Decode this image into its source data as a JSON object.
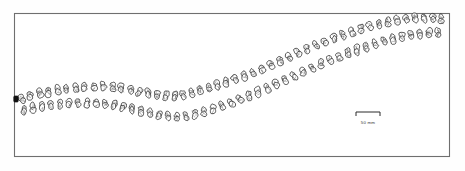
{
  "figure": {
    "background_color": "#ffffff",
    "ink_color": "#1d1d1d",
    "frame_color": "#6f6f6f"
  },
  "frame": {
    "x": 14,
    "y": 13,
    "width": 436,
    "height": 144,
    "stroke_width": 1.1
  },
  "scalebar": {
    "label": "50 mm",
    "x1": 356,
    "x2": 380,
    "y": 112,
    "tick_height": 4,
    "label_x": 368,
    "label_y": 124
  },
  "chart_data": {
    "type": "scatter",
    "xlabel": "",
    "ylabel": "",
    "xlim": [
      14,
      450
    ],
    "ylim": [
      13,
      157
    ],
    "grid": false,
    "legend": "none",
    "annotations": [
      "50 mm"
    ],
    "series": [
      {
        "name": "upper row",
        "points": [
          [
            22,
            99
          ],
          [
            30,
            96
          ],
          [
            40,
            93
          ],
          [
            48,
            92
          ],
          [
            58,
            90
          ],
          [
            66,
            89
          ],
          [
            76,
            88
          ],
          [
            84,
            87
          ],
          [
            94,
            87
          ],
          [
            103,
            86
          ],
          [
            113,
            87
          ],
          [
            121,
            88
          ],
          [
            131,
            90
          ],
          [
            139,
            92
          ],
          [
            148,
            93
          ],
          [
            157,
            95
          ],
          [
            166,
            96
          ],
          [
            175,
            96
          ],
          [
            183,
            95
          ],
          [
            192,
            93
          ],
          [
            200,
            90
          ],
          [
            209,
            88
          ],
          [
            217,
            85
          ],
          [
            226,
            82
          ],
          [
            235,
            79
          ],
          [
            244,
            76
          ],
          [
            253,
            73
          ],
          [
            262,
            69
          ],
          [
            271,
            65
          ],
          [
            280,
            61
          ],
          [
            289,
            57
          ],
          [
            298,
            53
          ],
          [
            307,
            49
          ],
          [
            316,
            45
          ],
          [
            325,
            42
          ],
          [
            334,
            38
          ],
          [
            343,
            35
          ],
          [
            352,
            32
          ],
          [
            361,
            29
          ],
          [
            370,
            26
          ],
          [
            379,
            24
          ],
          [
            388,
            22
          ],
          [
            397,
            20
          ],
          [
            406,
            19
          ],
          [
            415,
            18
          ],
          [
            424,
            18
          ],
          [
            433,
            18
          ],
          [
            441,
            19
          ]
        ]
      },
      {
        "name": "lower row",
        "points": [
          [
            24,
            110
          ],
          [
            33,
            108
          ],
          [
            42,
            106
          ],
          [
            51,
            105
          ],
          [
            60,
            104
          ],
          [
            69,
            103
          ],
          [
            78,
            103
          ],
          [
            87,
            103
          ],
          [
            96,
            103
          ],
          [
            105,
            104
          ],
          [
            114,
            105
          ],
          [
            123,
            107
          ],
          [
            132,
            109
          ],
          [
            141,
            111
          ],
          [
            150,
            113
          ],
          [
            159,
            115
          ],
          [
            168,
            116
          ],
          [
            177,
            117
          ],
          [
            186,
            116
          ],
          [
            195,
            114
          ],
          [
            204,
            112
          ],
          [
            213,
            109
          ],
          [
            222,
            106
          ],
          [
            231,
            103
          ],
          [
            240,
            99
          ],
          [
            249,
            96
          ],
          [
            258,
            92
          ],
          [
            267,
            88
          ],
          [
            276,
            84
          ],
          [
            285,
            80
          ],
          [
            294,
            76
          ],
          [
            303,
            72
          ],
          [
            312,
            68
          ],
          [
            321,
            64
          ],
          [
            330,
            60
          ],
          [
            339,
            57
          ],
          [
            348,
            53
          ],
          [
            357,
            50
          ],
          [
            366,
            47
          ],
          [
            375,
            44
          ],
          [
            384,
            41
          ],
          [
            393,
            39
          ],
          [
            402,
            37
          ],
          [
            411,
            35
          ],
          [
            420,
            34
          ],
          [
            429,
            33
          ],
          [
            438,
            33
          ]
        ]
      }
    ],
    "marker_note": "each point drawn as a pair of irregular rounded outlines (stones/cusps)",
    "special_markers": [
      {
        "name": "solid-datum-marker",
        "x": 16,
        "y": 99,
        "filled": true
      }
    ]
  }
}
